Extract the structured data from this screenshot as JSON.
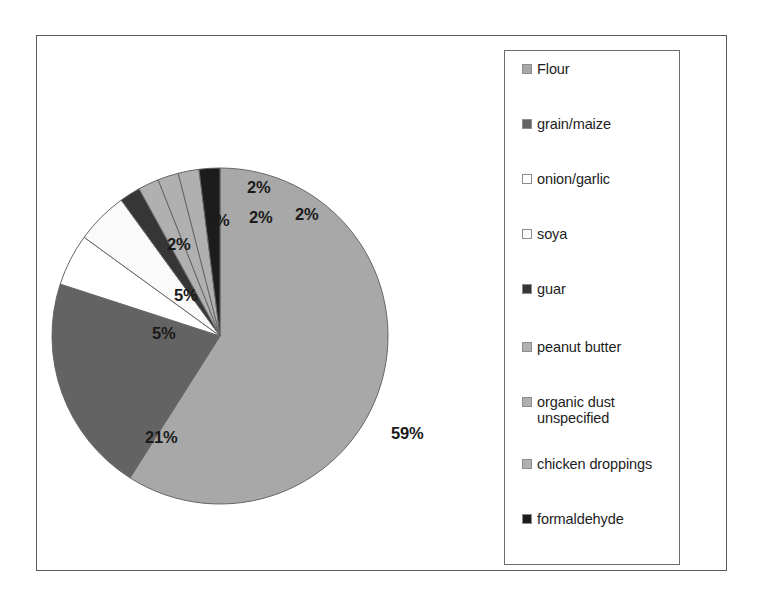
{
  "chart_data": {
    "type": "pie",
    "title": "",
    "subtitle": "",
    "xlabel": "",
    "ylabel": "",
    "legend_position": "right",
    "grid": false,
    "start_angle_deg": 0,
    "direction": "clockwise",
    "categories": [
      "Flour",
      "grain/maize",
      "onion/garlic",
      "soya",
      "guar",
      "peanut butter",
      "organic dust unspecified",
      "chicken droppings",
      "formaldehyde"
    ],
    "values": [
      59,
      21,
      5,
      5,
      2,
      2,
      2,
      2,
      2
    ],
    "value_labels": [
      "59%",
      "21%",
      "5%",
      "5%",
      "2%",
      "2%",
      "2%",
      "2%",
      "2%"
    ],
    "colors": [
      "#a8a8a8",
      "#636363",
      "#ffffff",
      "#fafafa",
      "#363636",
      "#b0b0b0",
      "#b0b0b0",
      "#b0b0b0",
      "#1c1c1c"
    ],
    "slice_border_color": "#666666",
    "units": "percent"
  },
  "pie": {
    "slices": [
      {
        "name": "Flour",
        "label": "59%",
        "value": 59,
        "color": "#a8a8a8"
      },
      {
        "name": "grain/maize",
        "label": "21%",
        "value": 21,
        "color": "#636363"
      },
      {
        "name": "onion/garlic",
        "label": "5%",
        "value": 5,
        "color": "#ffffff"
      },
      {
        "name": "soya",
        "label": "5%",
        "value": 5,
        "color": "#fafafa"
      },
      {
        "name": "guar",
        "label": "2%",
        "value": 2,
        "color": "#363636"
      },
      {
        "name": "peanut butter",
        "label": "2%",
        "value": 2,
        "color": "#b0b0b0"
      },
      {
        "name": "organic dust unspecified",
        "label": "2%",
        "value": 2,
        "color": "#b0b0b0"
      },
      {
        "name": "chicken droppings",
        "label": "2%",
        "value": 2,
        "color": "#b0b0b0"
      },
      {
        "name": "formaldehyde",
        "label": "2%",
        "value": 2,
        "color": "#1c1c1c"
      }
    ]
  },
  "labels": {
    "flour": "59%",
    "grain_maize": "21%",
    "onion_garlic": "5%",
    "soya": "5%",
    "guar": "2%",
    "peanut_butter": "2%",
    "organic_dust": "2%",
    "chicken_droppings": "2%",
    "formaldehyde": "2%"
  },
  "legend": {
    "items": [
      {
        "label": "Flour",
        "color": "#a8a8a8"
      },
      {
        "label": "grain/maize",
        "color": "#636363"
      },
      {
        "label": "onion/garlic",
        "color": "#ffffff"
      },
      {
        "label": "soya",
        "color": "#fafafa"
      },
      {
        "label": "guar",
        "color": "#363636"
      },
      {
        "label": "peanut butter",
        "color": "#b0b0b0"
      },
      {
        "label": "organic dust\nunspecified",
        "color": "#b0b0b0"
      },
      {
        "label": "chicken droppings",
        "color": "#b0b0b0"
      },
      {
        "label": "formaldehyde",
        "color": "#1c1c1c"
      }
    ]
  }
}
